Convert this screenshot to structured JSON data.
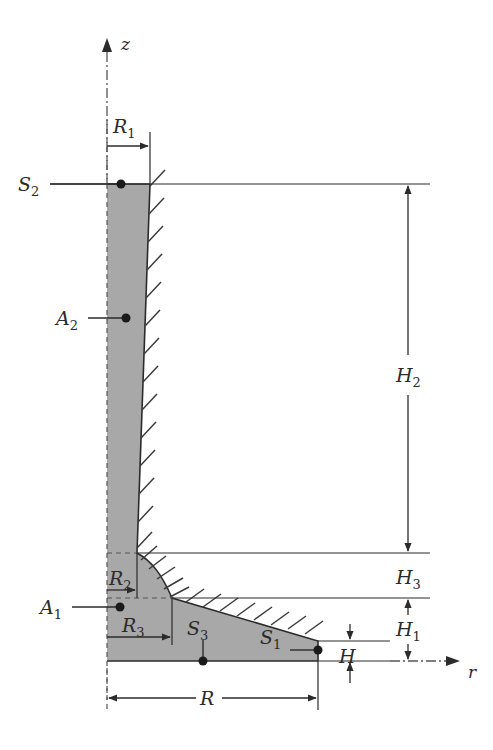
{
  "figure": {
    "caption": "",
    "colors": {
      "fill_gray": "#a8a8a8",
      "stroke": "#2b2b2b",
      "hatch": "#3a3a3a",
      "dash_axis": "#555555",
      "background": "#ffffff"
    }
  },
  "axes": {
    "vertical": {
      "label": "z",
      "name": "z-axis",
      "x": 107,
      "top_y": 40,
      "bottom_y": 700
    },
    "horizontal": {
      "label": "r",
      "name": "r-axis",
      "y": 661,
      "left_x": 318,
      "right_x": 458,
      "label_x": 470
    }
  },
  "surface_labels": [
    {
      "id": "S2",
      "base": "S",
      "sub": "2",
      "label_x": 20,
      "label_y": 190,
      "dot_x": 121,
      "dot_y": 184,
      "leader_from_x": 50,
      "leader_to_x": 118
    },
    {
      "id": "A2",
      "base": "A",
      "sub": "2",
      "label_x": 58,
      "label_y": 325,
      "dot_x": 126,
      "dot_y": 318,
      "leader_from_x": 88,
      "leader_to_x": 123
    },
    {
      "id": "A1",
      "base": "A",
      "sub": "1",
      "label_x": 42,
      "label_y": 614,
      "dot_x": 120,
      "dot_y": 607,
      "leader_from_x": 72,
      "leader_to_x": 117
    },
    {
      "id": "S3",
      "base": "S",
      "sub": "3",
      "label_x": 188,
      "label_y": 634,
      "dot_x": 203,
      "dot_y": 661,
      "leader_from_y": 640,
      "leader_to_y": 658
    },
    {
      "id": "S1",
      "base": "S",
      "sub": "1",
      "label_x": 262,
      "label_y": 643,
      "dot_x": 318,
      "dot_y": 650,
      "leader_from_x": 290,
      "leader_to_x": 315
    }
  ],
  "dimensions": [
    {
      "id": "R1",
      "base": "R",
      "sub": "1",
      "orientation": "horizontal",
      "from": 107,
      "to": 150,
      "at": 146,
      "label_x": 115,
      "label_y": 128
    },
    {
      "id": "R2",
      "base": "R",
      "sub": "2",
      "orientation": "horizontal",
      "from": 107,
      "to": 137,
      "at": 590,
      "label_x": 110,
      "label_y": 583
    },
    {
      "id": "R3",
      "base": "R",
      "sub": "3",
      "orientation": "horizontal",
      "from": 107,
      "to": 172,
      "at": 637,
      "label_x": 124,
      "label_y": 630
    },
    {
      "id": "R",
      "base": "R",
      "sub": "",
      "orientation": "horizontal",
      "from": 107,
      "to": 318,
      "at": 698,
      "label_x": 205,
      "label_y": 705
    },
    {
      "id": "H2",
      "base": "H",
      "sub": "2",
      "orientation": "vertical",
      "from": 184,
      "to": 553,
      "at": 408,
      "label_x": 418,
      "label_y": 375
    },
    {
      "id": "H3",
      "base": "H",
      "sub": "3",
      "orientation": "vertical",
      "from": 553,
      "to": 598,
      "at": 408,
      "label_x": 418,
      "label_y": 583
    },
    {
      "id": "H1",
      "base": "H",
      "sub": "1",
      "orientation": "vertical",
      "from": 598,
      "to": 661,
      "at": 408,
      "label_x": 418,
      "label_y": 628
    },
    {
      "id": "H",
      "base": "H",
      "sub": "",
      "orientation": "vertical",
      "from": 641,
      "to": 661,
      "at": 350,
      "label_x": 338,
      "label_y": 660
    }
  ],
  "geometry": {
    "body_outline": "M107,184 L150,184 L137,553 C160,565 166,578 172,598 L318,641 L318,661 L107,661 Z",
    "column_top_y": 184,
    "column_left_x": 107,
    "column_top_right_x": 150,
    "column_bottom_right_x": 137,
    "shelf_y": 553,
    "mid_shelf_y": 598,
    "base_top_y": 641,
    "base_bottom_y": 661,
    "outer_radius_x": 318
  },
  "reference_lines": [
    {
      "name": "top-surface-line",
      "x1": 50,
      "y1": 184,
      "x2": 430,
      "y2": 184
    },
    {
      "name": "shelf-line",
      "x1": 137,
      "y1": 553,
      "x2": 430,
      "y2": 553
    },
    {
      "name": "mid-shelf-line",
      "x1": 172,
      "y1": 598,
      "x2": 430,
      "y2": 598
    },
    {
      "name": "base-top-line",
      "x1": 318,
      "y1": 641,
      "x2": 390,
      "y2": 641
    },
    {
      "name": "base-bottom-line",
      "x1": 107,
      "y1": 661,
      "x2": 390,
      "y2": 661
    }
  ]
}
